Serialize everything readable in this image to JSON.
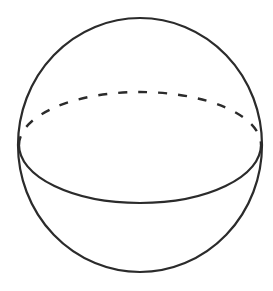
{
  "diagram": {
    "type": "sphere",
    "stroke_color": "#2b2b2b",
    "background": "#ffffff",
    "outline": {
      "cx": 140,
      "cy": 145,
      "rx": 122,
      "ry": 127
    },
    "equator": {
      "cx": 140,
      "cy": 150,
      "rx": 121,
      "ry": 53,
      "back_style": "dashed",
      "front_style": "solid"
    }
  }
}
